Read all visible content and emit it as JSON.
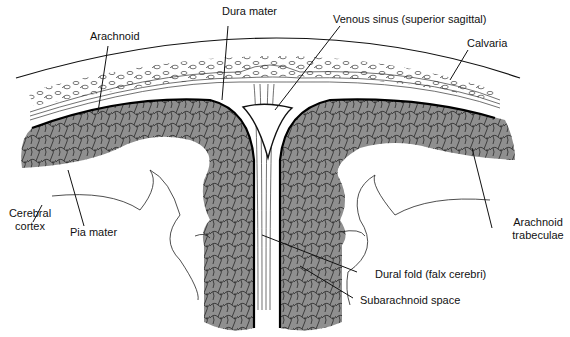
{
  "diagram": {
    "colors": {
      "cortex_fill": "#8f8f8f",
      "line": "#111111",
      "background": "#ffffff"
    },
    "labels": [
      {
        "id": "dura-mater",
        "text": "Dura mater"
      },
      {
        "id": "venous-sinus",
        "text": "Venous sinus (superior sagittal)"
      },
      {
        "id": "arachnoid",
        "text": "Arachnoid"
      },
      {
        "id": "calvaria",
        "text": "Calvaria"
      },
      {
        "id": "cerebral-cortex",
        "text": "Cerebral cortex"
      },
      {
        "id": "pia-mater",
        "text": "Pia mater"
      },
      {
        "id": "arachnoid-trabeculae",
        "text": "Arachnoid trabeculae"
      },
      {
        "id": "dural-fold",
        "text": "Dural fold (falx cerebri)"
      },
      {
        "id": "subarachnoid-space",
        "text": "Subarachnoid space"
      }
    ]
  }
}
